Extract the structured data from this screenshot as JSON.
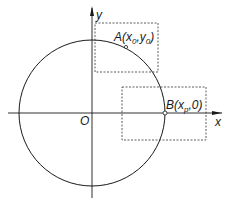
{
  "diagram": {
    "type": "coordinate-geometry",
    "colors": {
      "ink": "#1a1a1a",
      "background": "#ffffff",
      "dashed": "#333333"
    },
    "axes": {
      "x_label": "x",
      "y_label": "y",
      "origin_label": "O"
    },
    "circle": {
      "center": "O"
    },
    "points": [
      {
        "name": "A",
        "label_main": "A(x",
        "sub1": "0",
        "mid": ",y",
        "sub2": "0",
        "close": ")"
      },
      {
        "name": "B",
        "label_main": "B(x",
        "sub1": "p",
        "mid": ",0",
        "sub2": "",
        "close": ")"
      }
    ],
    "boxes": [
      {
        "name": "box-around-A",
        "style": "dashed"
      },
      {
        "name": "box-around-B",
        "style": "dashed"
      }
    ]
  }
}
